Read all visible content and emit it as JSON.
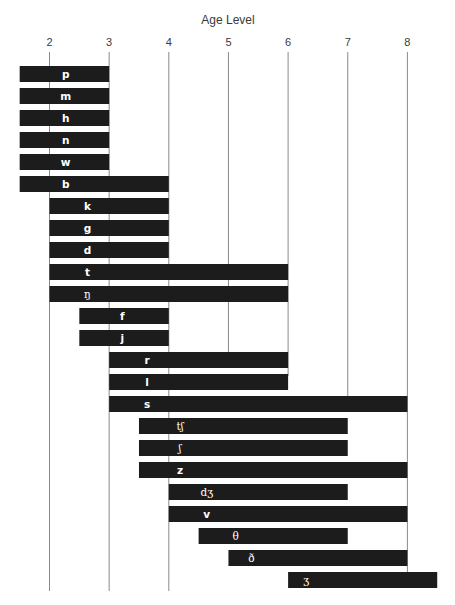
{
  "chart_data": {
    "type": "bar",
    "orientation": "horizontal-range",
    "title": "Age Level",
    "xlabel": "Age Level",
    "ylabel": "",
    "x_ticks": [
      2,
      3,
      4,
      5,
      6,
      7,
      8
    ],
    "xlim": [
      1.5,
      8.5
    ],
    "grid": true,
    "legend": null,
    "bar_color": "#1c1c1c",
    "label_color": "#ffffff",
    "series": [
      {
        "name": "p",
        "start": 1.5,
        "end": 3.0,
        "label_offset": 46,
        "ipa": false
      },
      {
        "name": "m",
        "start": 1.5,
        "end": 3.0,
        "label_offset": 46,
        "ipa": false
      },
      {
        "name": "h",
        "start": 1.5,
        "end": 3.0,
        "label_offset": 46,
        "ipa": false
      },
      {
        "name": "n",
        "start": 1.5,
        "end": 3.0,
        "label_offset": 46,
        "ipa": false
      },
      {
        "name": "w",
        "start": 1.5,
        "end": 3.0,
        "label_offset": 46,
        "ipa": false
      },
      {
        "name": "b",
        "start": 1.5,
        "end": 4.0,
        "label_offset": 46,
        "ipa": false
      },
      {
        "name": "k",
        "start": 2.0,
        "end": 4.0,
        "label_offset": 38,
        "ipa": false
      },
      {
        "name": "g",
        "start": 2.0,
        "end": 4.0,
        "label_offset": 38,
        "ipa": false
      },
      {
        "name": "d",
        "start": 2.0,
        "end": 4.0,
        "label_offset": 38,
        "ipa": false
      },
      {
        "name": "t",
        "start": 2.0,
        "end": 6.0,
        "label_offset": 38,
        "ipa": false
      },
      {
        "name": "ŋ",
        "start": 2.0,
        "end": 6.0,
        "label_offset": 38,
        "ipa": true
      },
      {
        "name": "f",
        "start": 2.5,
        "end": 4.0,
        "label_offset": 43,
        "ipa": false
      },
      {
        "name": "j",
        "start": 2.5,
        "end": 4.0,
        "label_offset": 43,
        "ipa": false
      },
      {
        "name": "r",
        "start": 3.0,
        "end": 6.0,
        "label_offset": 38,
        "ipa": false
      },
      {
        "name": "l",
        "start": 3.0,
        "end": 6.0,
        "label_offset": 38,
        "ipa": false
      },
      {
        "name": "s",
        "start": 3.0,
        "end": 8.0,
        "label_offset": 38,
        "ipa": false
      },
      {
        "name": "tʃ",
        "start": 3.5,
        "end": 7.0,
        "label_offset": 41,
        "ipa": true
      },
      {
        "name": "ʃ",
        "start": 3.5,
        "end": 7.0,
        "label_offset": 41,
        "ipa": true
      },
      {
        "name": "z",
        "start": 3.5,
        "end": 8.0,
        "label_offset": 41,
        "ipa": false
      },
      {
        "name": "dʒ",
        "start": 4.0,
        "end": 7.0,
        "label_offset": 38,
        "ipa": true
      },
      {
        "name": "v",
        "start": 4.0,
        "end": 8.0,
        "label_offset": 38,
        "ipa": false
      },
      {
        "name": "θ",
        "start": 4.5,
        "end": 7.0,
        "label_offset": 37,
        "ipa": true
      },
      {
        "name": "ð",
        "start": 5.0,
        "end": 8.0,
        "label_offset": 23,
        "ipa": true
      },
      {
        "name": "ʒ",
        "start": 6.0,
        "end": 8.5,
        "label_offset": 18,
        "ipa": true
      }
    ],
    "gridline_ends": {
      "2": 591,
      "3": 591,
      "4": 591,
      "5": 354,
      "6": 376,
      "7": 398,
      "8": 575
    }
  },
  "layout": {
    "x_origin_px": 49.5,
    "px_per_year": 59.65,
    "first_bar_top": 66,
    "bar_height": 16,
    "bar_pitch": 22,
    "grid_top": 52,
    "tick_label_y": 46,
    "title_y": 24
  }
}
